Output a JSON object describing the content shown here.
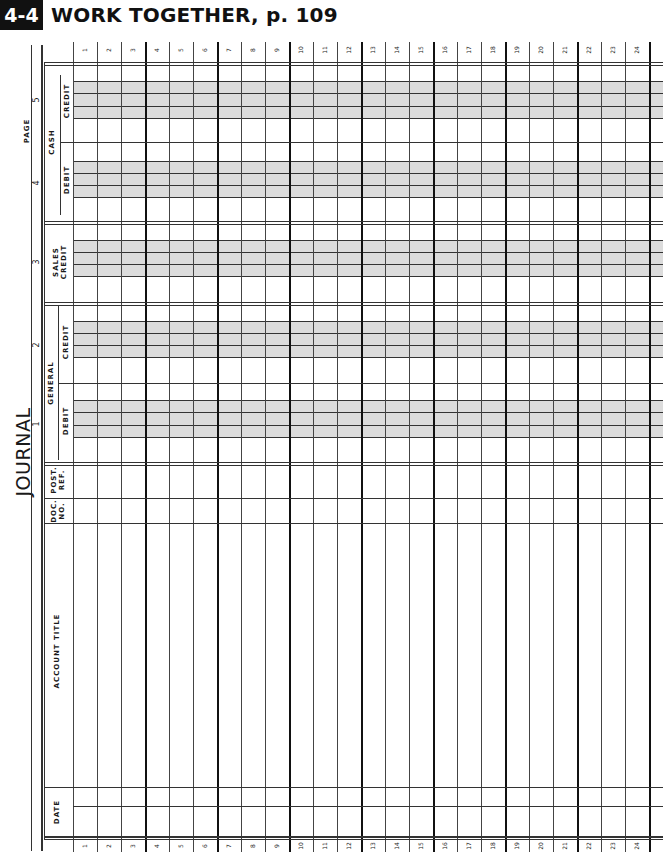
{
  "header": {
    "badge": "4-4",
    "title": "WORK TOGETHER, p. 109"
  },
  "journal": {
    "title": "JOURNAL",
    "page_label": "PAGE",
    "column_numbers": [
      "5",
      "4",
      "3",
      "2",
      "1"
    ],
    "groups": {
      "cash": "CASH",
      "sales_credit": [
        "SALES",
        "CREDIT"
      ],
      "general": "GENERAL"
    },
    "columns": {
      "cash_credit": "CREDIT",
      "cash_debit": "DEBIT",
      "general_credit": "CREDIT",
      "general_debit": "DEBIT",
      "post_ref": [
        "POST.",
        "REF."
      ],
      "doc_no": [
        "DOC.",
        "NO."
      ],
      "account_title": "ACCOUNT TITLE",
      "date": "DATE"
    },
    "rows": [
      "1",
      "2",
      "3",
      "4",
      "5",
      "6",
      "7",
      "8",
      "9",
      "10",
      "11",
      "12",
      "13",
      "14",
      "15",
      "16",
      "17",
      "18",
      "19",
      "20",
      "21",
      "22",
      "23",
      "24"
    ]
  },
  "colors": {
    "shading": "#dcdcdc",
    "rule": "#333333",
    "badge_bg": "#111111"
  }
}
